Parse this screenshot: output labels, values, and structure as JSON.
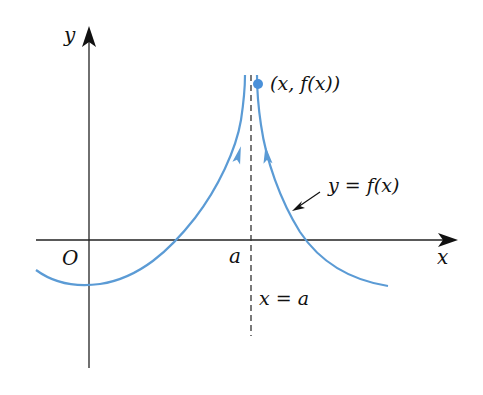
{
  "figure": {
    "colors": {
      "curve": "#5b9bd5",
      "axis": "#222222",
      "asymptote": "#333333",
      "point": "#4a90d9"
    },
    "axes": {
      "x_label": "x",
      "y_label": "y",
      "origin_label": "O",
      "a_label": "a"
    },
    "asymptote": {
      "label": "x = a"
    },
    "curve": {
      "label": "y = f(x)"
    },
    "point": {
      "label": "(x, f(x))"
    }
  }
}
